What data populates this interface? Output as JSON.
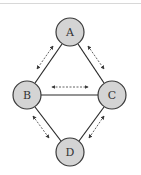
{
  "diagram": {
    "type": "network-graph",
    "colors": {
      "node_fill": "#d4d4d4",
      "node_stroke": "#3a3a3a",
      "edge": "#2a2a2a",
      "flow_arrow": "#3a3a3a",
      "top_rule": "#d8d8d8"
    },
    "nodes": [
      {
        "id": "A",
        "label": "A",
        "cx": 70,
        "cy": 32,
        "r": 14
      },
      {
        "id": "B",
        "label": "B",
        "cx": 27,
        "cy": 95,
        "r": 14
      },
      {
        "id": "C",
        "label": "C",
        "cx": 112,
        "cy": 95,
        "r": 14
      },
      {
        "id": "D",
        "label": "D",
        "cx": 70,
        "cy": 152,
        "r": 14
      }
    ],
    "edges": [
      {
        "from": "A",
        "to": "B",
        "style": "solid"
      },
      {
        "from": "A",
        "to": "C",
        "style": "solid"
      },
      {
        "from": "B",
        "to": "C",
        "style": "solid"
      },
      {
        "from": "B",
        "to": "D",
        "style": "solid"
      },
      {
        "from": "C",
        "to": "D",
        "style": "solid"
      }
    ],
    "flows": [
      {
        "between": [
          "A",
          "B"
        ],
        "style": "dashed",
        "direction": "bidirectional"
      },
      {
        "between": [
          "A",
          "C"
        ],
        "style": "dashed",
        "direction": "bidirectional"
      },
      {
        "between": [
          "B",
          "C"
        ],
        "style": "dashed",
        "direction": "bidirectional"
      },
      {
        "between": [
          "B",
          "D"
        ],
        "style": "dashed",
        "direction": "bidirectional"
      },
      {
        "between": [
          "C",
          "D"
        ],
        "style": "dashed",
        "direction": "bidirectional"
      }
    ]
  }
}
